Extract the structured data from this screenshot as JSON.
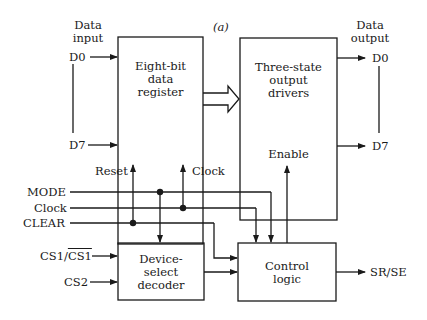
{
  "figure": {
    "label": "(a)",
    "data_input": {
      "title_line1": "Data",
      "title_line2": "input",
      "d0": "D0",
      "d7": "D7"
    },
    "data_output": {
      "title_line1": "Data",
      "title_line2": "output",
      "d0": "D0",
      "d7": "D7"
    },
    "register": {
      "line1": "Eight-bit",
      "line2": "data",
      "line3": "register",
      "reset": "Reset",
      "clock": "Clock"
    },
    "drivers": {
      "line1": "Three-state",
      "line2": "output",
      "line3": "drivers",
      "enable": "Enable"
    },
    "signals": {
      "mode": "MODE",
      "clock": "Clock",
      "clear": "CLEAR",
      "cs1_a": "CS1/",
      "cs1_b": "CS1",
      "cs2": "CS2"
    },
    "decoder": {
      "line1": "Device-",
      "line2": "select",
      "line3": "decoder"
    },
    "control": {
      "line1": "Control",
      "line2": "logic",
      "output": "SR/SE"
    }
  }
}
